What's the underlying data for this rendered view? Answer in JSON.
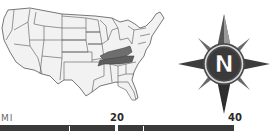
{
  "map": {
    "region": "Contiguous United States",
    "highlighted_states": [
      "Kentucky",
      "Tennessee"
    ],
    "colors": {
      "land": "#f2f2f2",
      "border": "#555555",
      "highlight": "#6e6e6e"
    }
  },
  "compass": {
    "icon": "compass-rose-icon",
    "letter": "N",
    "colors": {
      "ring": "#4a4a4a",
      "star": "#3c3c3c",
      "letter": "#ffffff"
    }
  },
  "scale": {
    "unit_label": "MI",
    "ticks": [
      "20",
      "40"
    ],
    "bar_color": "#3a3a3a"
  }
}
